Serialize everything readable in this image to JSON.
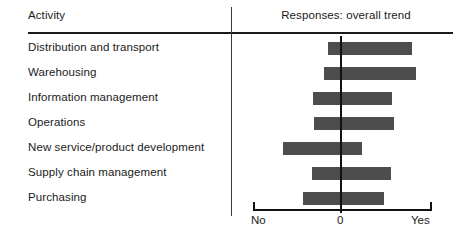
{
  "header": {
    "col_activity": "Activity",
    "col_responses": "Responses: overall trend"
  },
  "axis": {
    "left_label": "No",
    "center_label": "0",
    "right_label": "Yes"
  },
  "style": {
    "bar_color": "#4d4d4d",
    "line_color": "#111111",
    "text_color": "#1a1a1a"
  },
  "chart_data": {
    "type": "bar",
    "orientation": "horizontal",
    "title": "Responses: overall trend",
    "xlabel": "",
    "ylabel": "Activity",
    "xlim": [
      -1,
      1
    ],
    "grid": false,
    "legend": false,
    "tick_labels": [
      "No",
      "0",
      "Yes"
    ],
    "tick_values": [
      -1,
      0,
      1
    ],
    "note": "Each bar is a floating range (min to max) spanning the zero reference line",
    "categories": [
      "Distribution and transport",
      "Warehousing",
      "Information management",
      "Operations",
      "New service/product development",
      "Supply chain management",
      "Purchasing"
    ],
    "ranges": [
      {
        "label": "Distribution and transport",
        "low": -0.15,
        "high": 0.78
      },
      {
        "label": "Warehousing",
        "low": -0.19,
        "high": 0.82
      },
      {
        "label": "Information management",
        "low": -0.32,
        "high": 0.56
      },
      {
        "label": "Operations",
        "low": -0.31,
        "high": 0.58
      },
      {
        "label": "New service/product development",
        "low": -0.66,
        "high": 0.23
      },
      {
        "label": "Supply chain management",
        "low": -0.33,
        "high": 0.55
      },
      {
        "label": "Purchasing",
        "low": -0.43,
        "high": 0.47
      }
    ]
  },
  "layout": {
    "row_top_start": 36,
    "row_height": 25,
    "axis_left_px": 253,
    "axis_zero_px": 341,
    "axis_right_px": 432
  }
}
